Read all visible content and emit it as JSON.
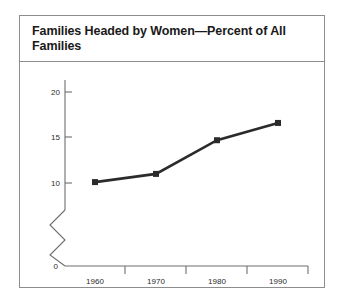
{
  "chart_data": {
    "type": "line",
    "title": "Families Headed by Women—Percent of All Families",
    "xlabel": "",
    "ylabel": "",
    "categories": [
      "1960",
      "1970",
      "1980",
      "1990"
    ],
    "x": [
      1960,
      1970,
      1980,
      1990
    ],
    "values": [
      10.1,
      11.0,
      14.7,
      16.6
    ],
    "series": [
      {
        "name": "Percent of all families headed by women",
        "values": [
          10.1,
          11.0,
          14.7,
          16.6
        ],
        "color": "#2b2b2b",
        "marker": "square"
      }
    ],
    "ylim": [
      0,
      21.5
    ],
    "y_ticks": [
      0,
      10,
      15,
      20
    ],
    "y_tick_labels": [
      "0",
      "10",
      "15",
      "20"
    ],
    "x_tick_labels": [
      "1960",
      "1970",
      "1980",
      "1990"
    ],
    "axis_break": true,
    "axis_break_note": "zigzag break on y-axis between 0 and 10",
    "grid": false,
    "legend": "none"
  },
  "figure": {
    "title": "Families Headed by Women—Percent of All Families",
    "background_color": "#ffffff",
    "border_color": "#8d8d8d",
    "line_color": "#2b2b2b",
    "axis_color": "#6e6e6e",
    "text_color": "#1a1a1a"
  },
  "axes": {
    "y_tick_0": "0",
    "y_tick_10": "10",
    "y_tick_15": "15",
    "y_tick_20": "20",
    "x_tick_1960": "1960",
    "x_tick_1970": "1970",
    "x_tick_1980": "1980",
    "x_tick_1990": "1990"
  }
}
